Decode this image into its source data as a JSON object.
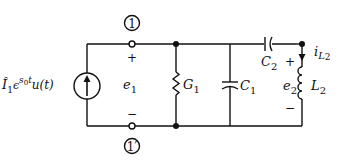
{
  "diagram": {
    "type": "circuit",
    "nodes": {
      "node1": "1",
      "node1prime": "1′"
    },
    "source": {
      "label_main": "Î",
      "label_sub": "1",
      "label_exp": "ϵ",
      "label_sup_s": "s",
      "label_sup_0": "0",
      "label_sup_t": "t",
      "label_tail": "u(t)"
    },
    "port_voltage": {
      "name": "e",
      "sub": "1",
      "plus": "+",
      "minus": "−"
    },
    "conductance": {
      "name": "G",
      "sub": "1"
    },
    "capacitor1": {
      "name": "C",
      "sub": "1"
    },
    "capacitor2": {
      "name": "C",
      "sub": "2"
    },
    "inductor": {
      "name": "L",
      "sub": "2"
    },
    "inductor_voltage": {
      "name": "e",
      "sub": "2",
      "plus": "+",
      "minus": "−"
    },
    "inductor_current": {
      "name": "i",
      "sub": "L",
      "subsub": "2"
    }
  }
}
